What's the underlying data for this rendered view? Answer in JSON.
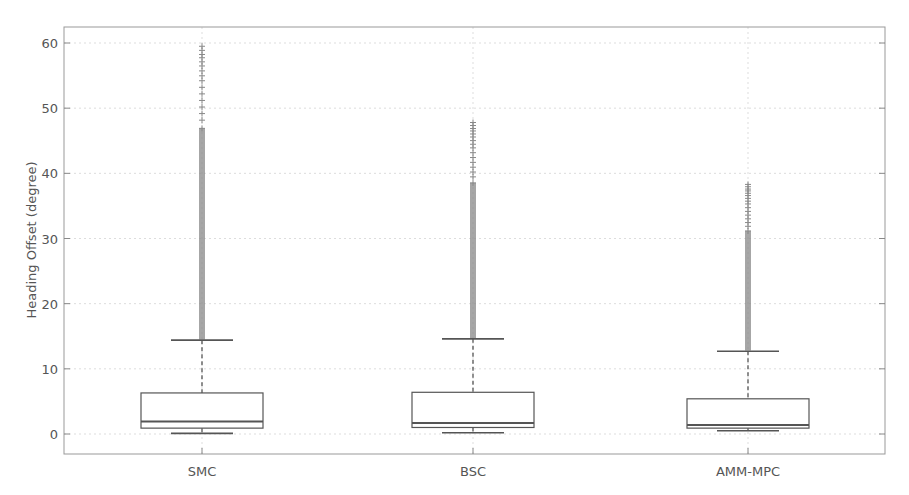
{
  "chart_data": {
    "type": "box",
    "title": "",
    "xlabel": "",
    "ylabel": "Heading Offset (degree)",
    "ylim": [
      -3,
      62.5
    ],
    "yticks": [
      0,
      10,
      20,
      30,
      40,
      50,
      60
    ],
    "grid": true,
    "legend": null,
    "categories": [
      "SMC",
      "BSC",
      "AMM-MPC"
    ],
    "series": [
      {
        "name": "SMC",
        "whisker_low": 0.1,
        "q1": 0.9,
        "median": 1.9,
        "q3": 6.3,
        "whisker_high": 14.4,
        "outlier_range": [
          14.5,
          59.5
        ],
        "outlier_max": 59.5
      },
      {
        "name": "BSC",
        "whisker_low": 0.2,
        "q1": 1.0,
        "median": 1.7,
        "q3": 6.4,
        "whisker_high": 14.6,
        "outlier_range": [
          14.7,
          47.8
        ],
        "outlier_max": 47.8
      },
      {
        "name": "AMM-MPC",
        "whisker_low": 0.5,
        "q1": 0.9,
        "median": 1.4,
        "q3": 5.4,
        "whisker_high": 12.7,
        "outlier_range": [
          12.8,
          38.3
        ],
        "outlier_max": 38.3
      }
    ],
    "colors": {
      "box": "#555555",
      "median": "#555555",
      "outlier": "#888888",
      "grid": "#dddddd",
      "axis": "#888888"
    }
  }
}
